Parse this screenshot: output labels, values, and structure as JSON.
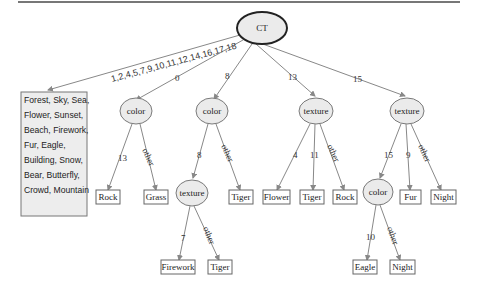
{
  "root": {
    "label": "CT"
  },
  "big_leaf": {
    "edge_label": "1,2,4,5,7,9,10,11,12,14,16,17,18",
    "lines": [
      "Forest, Sky, Sea,",
      "Flower, Sunset,",
      "Beach, Firework,",
      "Fur, Eagle,",
      "Building, Snow,",
      "Bear, Butterfly,",
      "Crowd, Mountain"
    ]
  },
  "level1": [
    {
      "edge_label": "0",
      "label": "color"
    },
    {
      "edge_label": "8",
      "label": "color"
    },
    {
      "edge_label": "13",
      "label": "texture"
    },
    {
      "edge_label": "15",
      "label": "texture"
    }
  ],
  "level2": {
    "color0": [
      {
        "edge_label": "13",
        "label": "Rock"
      },
      {
        "edge_label": "other",
        "label": "Grass"
      }
    ],
    "color8": [
      {
        "edge_label": "8",
        "label": "texture"
      },
      {
        "edge_label": "other",
        "label": "Tiger"
      }
    ],
    "texture13": [
      {
        "edge_label": "4",
        "label": "Flower"
      },
      {
        "edge_label": "11",
        "label": "Tiger"
      },
      {
        "edge_label": "other",
        "label": "Rock"
      }
    ],
    "texture15": [
      {
        "edge_label": "15",
        "label": "color"
      },
      {
        "edge_label": "9",
        "label": "Fur"
      },
      {
        "edge_label": "other",
        "label": "Night"
      }
    ]
  },
  "level3": {
    "texture8": [
      {
        "edge_label": "7",
        "label": "Firework"
      },
      {
        "edge_label": "other",
        "label": "Tiger"
      }
    ],
    "color15": [
      {
        "edge_label": "10",
        "label": "Eagle"
      },
      {
        "edge_label": "other",
        "label": "Night"
      }
    ]
  }
}
